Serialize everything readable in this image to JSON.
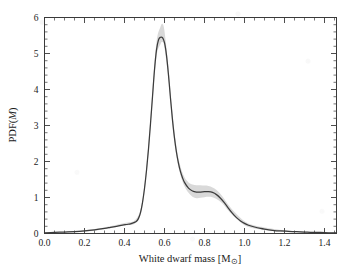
{
  "chart_data": {
    "type": "line",
    "title": "",
    "subtitle": "",
    "xlabel": "White dwarf mass [M⊙]",
    "xlabel_parts": {
      "text": "White dwarf mass [M",
      "sub": "⊙",
      "close": "]"
    },
    "ylabel": "PDF(M)",
    "ylabel_parts": {
      "prefix": "PDF(",
      "italic": "M",
      "suffix": ")"
    },
    "xlim": [
      0.0,
      1.46
    ],
    "ylim": [
      0.0,
      6.0
    ],
    "grid": false,
    "legend": null,
    "xticks": [
      0.0,
      0.2,
      0.4,
      0.6,
      0.8,
      1.0,
      1.2,
      1.4
    ],
    "xticklabels": [
      "0.0",
      "0.2",
      "0.4",
      "0.6",
      "0.8",
      "1.0",
      "1.2",
      "1.4"
    ],
    "yticks": [
      0,
      1,
      2,
      3,
      4,
      5,
      6
    ],
    "yticklabels": [
      "0",
      "1",
      "2",
      "3",
      "4",
      "5",
      "6"
    ],
    "x_minor_step": 0.05,
    "y_minor_step": 0.2,
    "series": [
      {
        "name": "PDF(M)",
        "color": "#3c3c3c",
        "x": [
          0.0,
          0.05,
          0.1,
          0.15,
          0.2,
          0.25,
          0.3,
          0.33,
          0.36,
          0.39,
          0.41,
          0.43,
          0.44,
          0.45,
          0.46,
          0.47,
          0.48,
          0.49,
          0.5,
          0.51,
          0.52,
          0.53,
          0.54,
          0.55,
          0.56,
          0.57,
          0.58,
          0.59,
          0.6,
          0.61,
          0.62,
          0.63,
          0.64,
          0.65,
          0.66,
          0.67,
          0.68,
          0.69,
          0.7,
          0.72,
          0.74,
          0.76,
          0.78,
          0.8,
          0.82,
          0.84,
          0.86,
          0.88,
          0.9,
          0.92,
          0.94,
          0.96,
          0.98,
          1.0,
          1.02,
          1.05,
          1.08,
          1.1,
          1.14,
          1.18,
          1.22,
          1.26,
          1.3,
          1.34,
          1.38,
          1.42,
          1.46
        ],
        "y": [
          0.02,
          0.03,
          0.04,
          0.05,
          0.07,
          0.1,
          0.14,
          0.17,
          0.2,
          0.23,
          0.25,
          0.27,
          0.29,
          0.31,
          0.34,
          0.42,
          0.58,
          0.86,
          1.25,
          1.75,
          2.35,
          3.05,
          3.8,
          4.55,
          5.1,
          5.38,
          5.45,
          5.44,
          5.3,
          4.95,
          4.4,
          3.75,
          3.15,
          2.65,
          2.25,
          1.95,
          1.72,
          1.55,
          1.42,
          1.26,
          1.18,
          1.15,
          1.15,
          1.16,
          1.16,
          1.14,
          1.08,
          0.98,
          0.85,
          0.7,
          0.56,
          0.44,
          0.35,
          0.28,
          0.23,
          0.18,
          0.14,
          0.12,
          0.09,
          0.07,
          0.06,
          0.05,
          0.04,
          0.03,
          0.03,
          0.02,
          0.02
        ]
      }
    ],
    "uncertainty_band": {
      "name": "1-sigma band",
      "color": "#b9b9b9",
      "x": [
        0.0,
        0.1,
        0.2,
        0.3,
        0.4,
        0.45,
        0.48,
        0.5,
        0.52,
        0.54,
        0.56,
        0.58,
        0.59,
        0.6,
        0.62,
        0.64,
        0.66,
        0.68,
        0.7,
        0.72,
        0.74,
        0.76,
        0.78,
        0.8,
        0.82,
        0.84,
        0.86,
        0.88,
        0.9,
        0.92,
        0.95,
        1.0,
        1.05,
        1.1,
        1.2,
        1.3,
        1.46
      ],
      "y_lower": [
        0.01,
        0.03,
        0.05,
        0.12,
        0.22,
        0.27,
        0.52,
        1.16,
        2.22,
        3.65,
        4.92,
        5.26,
        5.32,
        5.16,
        4.28,
        3.03,
        2.14,
        1.62,
        1.31,
        1.13,
        1.02,
        0.98,
        0.99,
        1.01,
        1.02,
        1.01,
        0.96,
        0.88,
        0.77,
        0.63,
        0.46,
        0.23,
        0.14,
        0.1,
        0.04,
        0.02,
        0.01
      ],
      "y_upper": [
        0.03,
        0.05,
        0.09,
        0.17,
        0.29,
        0.36,
        0.66,
        1.36,
        2.5,
        3.98,
        5.32,
        5.74,
        5.82,
        5.62,
        4.6,
        3.33,
        2.4,
        1.86,
        1.56,
        1.42,
        1.36,
        1.34,
        1.34,
        1.33,
        1.32,
        1.28,
        1.21,
        1.1,
        0.95,
        0.79,
        0.6,
        0.34,
        0.22,
        0.17,
        0.09,
        0.05,
        0.04
      ]
    },
    "annotations": [
      {
        "label": "primary peak",
        "x": 0.59,
        "y": 5.45
      },
      {
        "label": "secondary shoulder",
        "x": 0.81,
        "y": 1.16
      }
    ]
  },
  "figure": {
    "background_color": "#ffffff",
    "axes_color": "#3a3a3a",
    "curve_color": "#3c3c3c",
    "band_color": "#b9b9b9"
  }
}
